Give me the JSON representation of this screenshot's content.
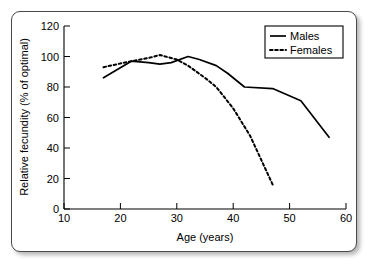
{
  "chart_data": {
    "type": "line",
    "title": "",
    "xlabel": "Age (years)",
    "ylabel": "Relative fecundity (% of optimal)",
    "xlim": [
      10,
      60
    ],
    "ylim": [
      0,
      120
    ],
    "xticks": [
      10,
      20,
      30,
      40,
      50,
      60
    ],
    "yticks": [
      0,
      20,
      40,
      60,
      80,
      100,
      120
    ],
    "xtick_labels": [
      "10",
      "20",
      "30",
      "40",
      "50",
      "60"
    ],
    "ytick_labels": [
      "0",
      "20",
      "40",
      "60",
      "80",
      "100",
      "120"
    ],
    "grid": false,
    "legend_position": "top-right",
    "series": [
      {
        "name": "Males",
        "style": "solid",
        "color": "#000000",
        "x": [
          17,
          22,
          25,
          27,
          29,
          32,
          34,
          37,
          39,
          42,
          47,
          52,
          57
        ],
        "y": [
          86,
          97,
          96,
          95,
          96,
          100,
          98,
          94,
          89,
          80,
          79,
          71,
          47
        ]
      },
      {
        "name": "Females",
        "style": "dotted",
        "color": "#000000",
        "x": [
          17,
          22,
          25,
          27,
          30,
          32,
          35,
          37,
          40,
          43,
          45,
          47
        ],
        "y": [
          93,
          97,
          99,
          101,
          98,
          94,
          86,
          80,
          66,
          48,
          32,
          16
        ]
      }
    ]
  },
  "legend": {
    "entries": [
      {
        "label": "Males",
        "style": "solid"
      },
      {
        "label": "Females",
        "style": "dotted"
      }
    ]
  }
}
